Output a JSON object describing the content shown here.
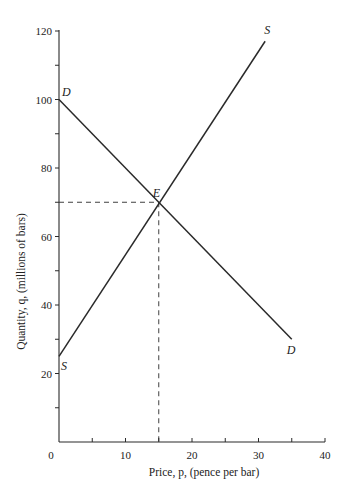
{
  "chart_data": {
    "type": "line",
    "title": "",
    "xlabel": "Price, p, (pence per bar)",
    "ylabel": "Quantity, q, (millions of bars)",
    "xlim": [
      0,
      40
    ],
    "ylim": [
      0,
      120
    ],
    "x_ticks": [
      0,
      5,
      10,
      15,
      20,
      25,
      30,
      35,
      40
    ],
    "x_tick_labels": [
      "0",
      "10",
      "20",
      "30",
      "40"
    ],
    "x_tick_label_values": [
      0,
      10,
      20,
      30,
      40
    ],
    "y_ticks": [
      10,
      20,
      30,
      40,
      50,
      60,
      70,
      80,
      90,
      100,
      110,
      120
    ],
    "y_tick_labels": [
      "20",
      "40",
      "60",
      "80",
      "100",
      "120"
    ],
    "y_tick_label_values": [
      20,
      40,
      60,
      80,
      100,
      120
    ],
    "grid": false,
    "legend": null,
    "series": [
      {
        "name": "D",
        "label_start": "D",
        "label_end": "D",
        "x": [
          0,
          35
        ],
        "y": [
          100,
          30
        ]
      },
      {
        "name": "S",
        "label_start": "S",
        "label_end": "S",
        "x": [
          0,
          31
        ],
        "y": [
          25,
          117
        ]
      }
    ],
    "annotations": [
      {
        "label": "E",
        "type": "equilibrium-point",
        "x": 15,
        "y": 70,
        "dashed_guides": true
      }
    ]
  },
  "labels": {
    "xlabel": "Price, p, (pence per bar)",
    "ylabel": "Quantity, q, (millions of bars)",
    "origin": "0",
    "equilibrium": "E",
    "demand_start": "D",
    "demand_end": "D",
    "supply_start": "S",
    "supply_end": "S"
  }
}
